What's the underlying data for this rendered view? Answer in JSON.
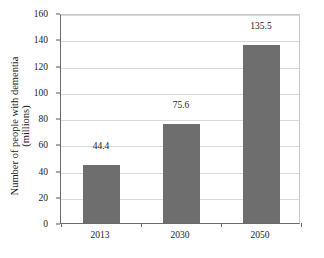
{
  "chart_data": {
    "type": "bar",
    "title": "",
    "subtitle": "",
    "xlabel": "",
    "ylabel": "Number of people with dementia (millions)",
    "ylabel_lines": [
      "Number of people with dementia",
      "(millions)"
    ],
    "categories": [
      "2013",
      "2030",
      "2050"
    ],
    "values": [
      44.4,
      75.6,
      135.5
    ],
    "data_labels": [
      "44.4",
      "75.6",
      "135.5"
    ],
    "ylim": [
      0,
      160
    ],
    "ytick_values": [
      0,
      20,
      40,
      60,
      80,
      100,
      120,
      140,
      160
    ],
    "ytick_labels": [
      "0",
      "20",
      "40",
      "60",
      "80",
      "100",
      "120",
      "140",
      "160"
    ],
    "grid": true,
    "grid_axis": "y",
    "legend": false,
    "legend_position": "none",
    "bar_color": "#6e6e6e",
    "grid_color": "#d8d8d8",
    "axis_color": "#6a6a6a",
    "background_color": "#ffffff",
    "text_color": "#1a1a1a"
  }
}
